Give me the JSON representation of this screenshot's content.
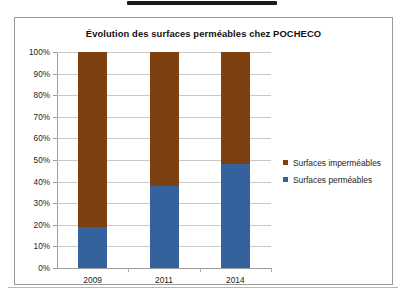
{
  "chart_data": {
    "type": "bar",
    "subtype": "stacked-100-percent",
    "title": "Évolution des surfaces perméables chez POCHECO",
    "xlabel": "",
    "ylabel": "",
    "categories": [
      "2009",
      "2011",
      "2014"
    ],
    "series": [
      {
        "name": "Surfaces perméables",
        "color": "#35629E",
        "values": [
          19,
          38,
          48
        ],
        "stack_order": 0
      },
      {
        "name": "Surfaces imperméables",
        "color": "#7B3F10",
        "values": [
          81,
          62,
          52
        ],
        "stack_order": 1
      }
    ],
    "ylim": [
      0,
      100
    ],
    "y_ticks": [
      0,
      10,
      20,
      30,
      40,
      50,
      60,
      70,
      80,
      90,
      100
    ],
    "y_tick_labels": [
      "0%",
      "10%",
      "20%",
      "30%",
      "40%",
      "50%",
      "60%",
      "70%",
      "80%",
      "90%",
      "100%"
    ],
    "grid": true,
    "grid_axis": "y",
    "legend": {
      "position": "right",
      "entries": [
        {
          "label": "Surfaces imperméables",
          "color": "#7B3F10"
        },
        {
          "label": "Surfaces perméables",
          "color": "#35629E"
        }
      ]
    },
    "value_suffix": "%"
  },
  "frame": {
    "border_color": "#9a9a9a",
    "background": "#ffffff"
  }
}
